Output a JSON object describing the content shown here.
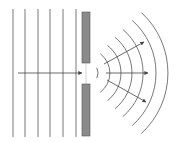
{
  "diagram": {
    "colors": {
      "line": "#555555",
      "barrier_fill": "#8a8a8a",
      "barrier_stroke": "#555555",
      "background": "#ffffff"
    },
    "incident_wavefronts": {
      "count": 6,
      "x_positions": [
        13,
        25,
        38,
        50,
        63,
        76
      ],
      "y_top": 9,
      "y_bottom": 137
    },
    "barrier": {
      "x": 82,
      "width": 8,
      "top_block": {
        "y": 12,
        "height": 51
      },
      "bottom_block": {
        "y": 84,
        "height": 52
      },
      "slit_center_y": 73
    },
    "incident_ray": {
      "x1": 18,
      "y1": 73,
      "x2": 82,
      "y2": 73
    },
    "diffracted_wavefronts": {
      "center_x": 86,
      "center_y": 73,
      "radii": [
        12,
        24,
        35,
        46,
        57,
        70,
        82
      ]
    },
    "diffracted_rays": [
      {
        "label": "upper",
        "x1": 104,
        "y1": 64,
        "x2": 144,
        "y2": 42
      },
      {
        "label": "center",
        "x1": 106,
        "y1": 73,
        "x2": 148,
        "y2": 73
      },
      {
        "label": "lower",
        "x1": 107,
        "y1": 80,
        "x2": 146,
        "y2": 102
      }
    ]
  }
}
